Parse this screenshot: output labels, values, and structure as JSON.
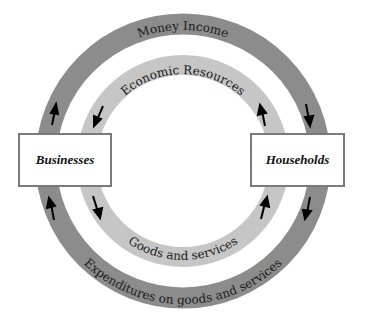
{
  "diagram": {
    "nodes": {
      "businesses": {
        "label": "Businesses"
      },
      "households": {
        "label": "Households"
      }
    },
    "flows": {
      "outer_top": {
        "label": "Money Income",
        "from": "Businesses",
        "to": "Households"
      },
      "inner_top": {
        "label": "Economic Resources",
        "from": "Households",
        "to": "Businesses"
      },
      "inner_bottom": {
        "label": "Goods and services",
        "from": "Businesses",
        "to": "Households"
      },
      "outer_bottom": {
        "label": "Expenditures on goods and services",
        "from": "Households",
        "to": "Businesses"
      }
    },
    "colors": {
      "outer_ring": "#8c8c8c",
      "inner_ring": "#c6c6c6",
      "arrow": "#000000",
      "box_border": "#7a7a7a"
    }
  }
}
